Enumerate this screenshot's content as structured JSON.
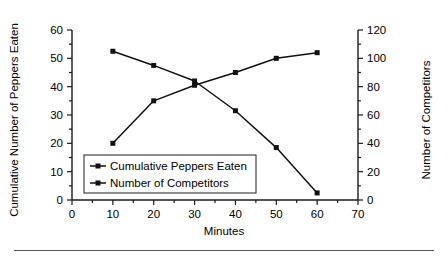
{
  "chart_data": {
    "type": "line",
    "title": "",
    "xlabel": "Minutes",
    "ylabel": "Cumulative Number of Peppers Eaten",
    "y2label": "Number of Competitors",
    "xlim": [
      0,
      70
    ],
    "ylim": [
      0,
      60
    ],
    "y2lim": [
      0,
      120
    ],
    "xticks": [
      "0",
      "10",
      "20",
      "30",
      "40",
      "50",
      "60",
      "70"
    ],
    "xtick_values": [
      0,
      10,
      20,
      30,
      40,
      50,
      60,
      70
    ],
    "yticks": [
      "0",
      "10",
      "20",
      "30",
      "40",
      "50",
      "60"
    ],
    "ytick_values": [
      0,
      10,
      20,
      30,
      40,
      50,
      60
    ],
    "y2ticks": [
      "0",
      "20",
      "40",
      "60",
      "80",
      "100",
      "120"
    ],
    "y2tick_values": [
      0,
      20,
      40,
      60,
      80,
      100,
      120
    ],
    "grid": false,
    "legend_position": "inside-lower-left",
    "x": [
      10,
      20,
      30,
      40,
      50,
      60
    ],
    "series": [
      {
        "name": "Cumulative Peppers Eaten",
        "axis": "left",
        "marker": "square",
        "color": "#111111",
        "values": [
          20,
          35,
          40.5,
          45,
          50,
          52
        ]
      },
      {
        "name": "Number of Competitors",
        "axis": "right",
        "marker": "square",
        "color": "#111111",
        "values": [
          105,
          95,
          84,
          63,
          37,
          5
        ]
      }
    ]
  },
  "legend": {
    "entries": [
      {
        "label": "Cumulative Peppers Eaten"
      },
      {
        "label": "Number of Competitors"
      }
    ]
  }
}
